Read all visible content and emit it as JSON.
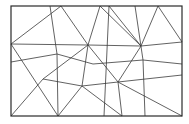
{
  "diagram": {
    "title": "",
    "stroke_color": "#3a3a3a",
    "frame_color": "#2a2a2a",
    "background": "#ffffff",
    "frame": {
      "x": 11,
      "y": 6,
      "width": 171,
      "height": 110
    },
    "vertices": {
      "A": [
        50,
        6
      ],
      "B": [
        61,
        6
      ],
      "C": [
        100,
        6
      ],
      "D": [
        109,
        6
      ],
      "E": [
        135,
        6
      ],
      "F": [
        158,
        6
      ],
      "L1": [
        11,
        44
      ],
      "L2": [
        11,
        62
      ],
      "R1": [
        182,
        42
      ],
      "R2": [
        182,
        64
      ],
      "R3": [
        182,
        75
      ],
      "P1": [
        88,
        45
      ],
      "P2": [
        141,
        46
      ],
      "Q1": [
        57,
        54
      ],
      "Q2": [
        93,
        64
      ],
      "Q3": [
        143,
        60
      ],
      "S1": [
        43,
        79
      ],
      "S2": [
        82,
        86
      ],
      "S3": [
        118,
        82
      ],
      "B1": [
        58,
        116
      ],
      "B2": [
        104,
        116
      ],
      "B3": [
        122,
        116
      ],
      "B4": [
        145,
        116
      ],
      "BL": [
        11,
        116
      ],
      "BR": [
        182,
        116
      ]
    },
    "edges": [
      [
        "L1",
        "B1"
      ],
      [
        "L1",
        "P1"
      ],
      [
        "L1",
        "B"
      ],
      [
        "B",
        "P1"
      ],
      [
        "A",
        "Q1"
      ],
      [
        "Q1",
        "B1"
      ],
      [
        "L2",
        "Q1"
      ],
      [
        "Q1",
        "Q2"
      ],
      [
        "Q2",
        "Q3"
      ],
      [
        "Q3",
        "R2"
      ],
      [
        "P1",
        "P2"
      ],
      [
        "P2",
        "R1"
      ],
      [
        "C",
        "P1"
      ],
      [
        "C",
        "P2"
      ],
      [
        "D",
        "P2"
      ],
      [
        "F",
        "P2"
      ],
      [
        "F",
        "R1"
      ],
      [
        "E",
        "Q3"
      ],
      [
        "Q3",
        "B4"
      ],
      [
        "P1",
        "S1"
      ],
      [
        "S1",
        "BL"
      ],
      [
        "S1",
        "S2"
      ],
      [
        "S2",
        "S3"
      ],
      [
        "S3",
        "R3"
      ],
      [
        "P1",
        "S3"
      ],
      [
        "S3",
        "BR"
      ],
      [
        "P2",
        "S3"
      ],
      [
        "P1",
        "S2"
      ],
      [
        "S2",
        "B1"
      ],
      [
        "S2",
        "B3"
      ],
      [
        "D",
        "B2"
      ],
      [
        "S3",
        "B3"
      ]
    ]
  }
}
